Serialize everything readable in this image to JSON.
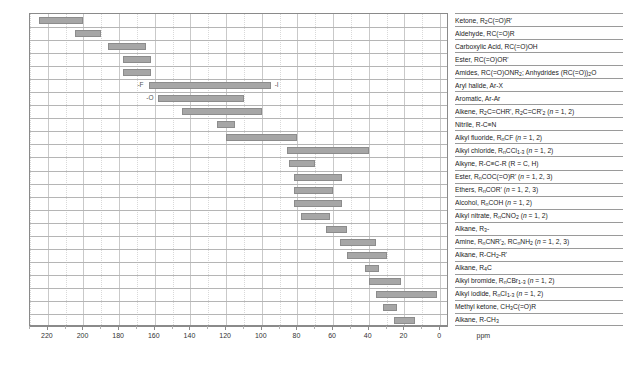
{
  "chart_data": {
    "type": "bar",
    "orientation": "horizontal-range",
    "title": "",
    "xlabel": "ppm",
    "ylabel": "",
    "xlim": [
      230,
      -5
    ],
    "axis_reversed": true,
    "ticks": [
      220,
      200,
      180,
      160,
      140,
      120,
      100,
      80,
      60,
      40,
      20,
      0
    ],
    "tick_labels": [
      "220",
      "200",
      "180",
      "160",
      "140",
      "120",
      "100",
      "80",
      "60",
      "40",
      "20",
      "0"
    ],
    "unit_label": "ppm",
    "grid": "vertical-major-and-minor",
    "legend": "none",
    "bar_color": "#a6a6a6",
    "bar_border_color": "#8c8c8c",
    "categories": [
      "Ketone, R2C(=O)R'",
      "Aldehyde, RC(=O)R",
      "Carboxylic Acid, RC(=O)OH",
      "Ester, RC(=O)OR'",
      "Amides, RC(=O)ONR2; Anhydrides (RC(=O))2O",
      "Aryl halide, Ar-X",
      "Aromatic, Ar-Ar",
      "Alkene, R2C=CHR', R2C=CR'2 (n = 1, 2)",
      "Nitrile, R-C≡N",
      "Alkyl fluoride, RnCF (n = 1, 2)",
      "Alkyl chloride, RnCCl1-3 (n = 1, 2)",
      "Alkyne, R-C≡C-R (R = C, H)",
      "Ester, RnCOC(=O)R' (n = 1, 2, 3)",
      "Ethers, RnCOR' (n = 1, 2, 3)",
      "Alcohol, RnCOH (n = 1, 2)",
      "Alkyl nitrate, RnCNO2 (n = 1, 2)",
      "Alkane, R3C-",
      "Amine, RnCNR'2, RCCNH2 (n = 1, 2, 3)",
      "Alkane, R-CH2-R'",
      "Alkane, R4C",
      "Alkyl bromide, RnCBr1-3 (n = 1, 2)",
      "Alkyl iodide, RnCI1-3 (n = 1, 2)",
      "Methyl ketone, CH3C(=O)R",
      "Alkane, R-CH3"
    ],
    "ranges": [
      {
        "label": "Ketone, R2C(=O)R'",
        "start": 225,
        "end": 200
      },
      {
        "label": "Aldehyde, RC(=O)R",
        "start": 205,
        "end": 190
      },
      {
        "label": "Carboxylic Acid, RC(=O)OH",
        "start": 186,
        "end": 165
      },
      {
        "label": "Ester, RC(=O)OR'",
        "start": 178,
        "end": 162
      },
      {
        "label": "Amides, RC(=O)ONR2; Anhydrides (RC(=O))2O",
        "start": 178,
        "end": 162
      },
      {
        "label": "Aryl halide, Ar-X",
        "start": 163,
        "end": 95,
        "left_note": "-F",
        "right_note": "-I"
      },
      {
        "label": "Aromatic, Ar-Ar",
        "start": 158,
        "end": 110,
        "left_note": "-O"
      },
      {
        "label": "Alkene, R2C=CHR', R2C=CR'2 (n = 1, 2)",
        "start": 145,
        "end": 100
      },
      {
        "label": "Nitrile, R-C≡N",
        "start": 125,
        "end": 115
      },
      {
        "label": "Alkyl fluoride, RnCF (n = 1, 2)",
        "start": 120,
        "end": 80
      },
      {
        "label": "Alkyl chloride, RnCCl1-3 (n = 1, 2)",
        "start": 86,
        "end": 40
      },
      {
        "label": "Alkyne, R-C≡C-R (R = C, H)",
        "start": 85,
        "end": 70
      },
      {
        "label": "Ester, RnCOC(=O)R' (n = 1, 2, 3)",
        "start": 82,
        "end": 55
      },
      {
        "label": "Ethers, RnCOR' (n = 1, 2, 3)",
        "start": 82,
        "end": 60
      },
      {
        "label": "Alcohol, RnCOH (n = 1, 2)",
        "start": 82,
        "end": 55
      },
      {
        "label": "Alkyl nitrate, RnCNO2 (n = 1, 2)",
        "start": 78,
        "end": 62
      },
      {
        "label": "Alkane, R3C-",
        "start": 64,
        "end": 52
      },
      {
        "label": "Amine, RnCNR'2, RCCNH2 (n = 1, 2, 3)",
        "start": 56,
        "end": 36
      },
      {
        "label": "Alkane, R-CH2-R'",
        "start": 52,
        "end": 30
      },
      {
        "label": "Alkane, R4C",
        "start": 42,
        "end": 34
      },
      {
        "label": "Alkyl bromide, RnCBr1-3 (n = 1, 2)",
        "start": 40,
        "end": 22
      },
      {
        "label": "Alkyl iodide, RnCI1-3 (n = 1, 2)",
        "start": 36,
        "end": 2
      },
      {
        "label": "Methyl ketone, CH3C(=O)R",
        "start": 32,
        "end": 24
      },
      {
        "label": "Alkane, R-CH3",
        "start": 26,
        "end": 14
      }
    ]
  },
  "labels_html": [
    "Ketone, R<sub>2</sub>C(=O)R'",
    "Aldehyde, RC(=O)R",
    "Carboxylic Acid, RC(=O)OH",
    "Ester, RC(=O)OR'",
    "Amides, RC(=O)ONR<sub>2</sub>; Anhydrides (RC(=O))<sub>2</sub>O",
    "Aryl halide, Ar-X",
    "Aromatic, Ar-Ar",
    "Alkene, R<sub>2</sub>C=CHR', R<sub>2</sub>C=CR'<sub>2</sub> (<i>n</i> = 1, 2)",
    "Nitrile, R-C&#8801;N",
    "Alkyl fluoride, R<sub>n</sub>CF (<i>n</i> = 1, 2)",
    "Alkyl chloride, R<sub>n</sub>CCl<sub>1-3</sub> (<i>n</i> = 1, 2)",
    "Alkyne, R-C&#8801;C-R (R = C, H)",
    "Ester, R<sub>n</sub>COC(=O)R' (<i>n</i> = 1, 2, 3)",
    "Ethers, R<sub>n</sub>COR' (<i>n</i> = 1, 2, 3)",
    "Alcohol, R<sub>n</sub>COH (<i>n</i> = 1, 2)",
    "Alkyl nitrate, R<sub>n</sub>CNO<sub>2</sub> (<i>n</i> = 1, 2)",
    "Alkane, R<sub>3</sub>-",
    "Amine, R<sub>n</sub>CNR'<sub>2</sub>, RC<sub>n</sub>NH<sub>2</sub> (<i>n</i> = 1, 2, 3)",
    "Alkane, R-CH<sub>2</sub>-R'",
    "Alkane, R<sub>4</sub>C",
    "Alkyl bromide, R<sub>n</sub>CBr<sub>1-3</sub> (<i>n</i> = 1, 2)",
    "Alkyl iodide, R<sub>n</sub>CI<sub>1-3</sub> (<i>n</i> = 1, 2)",
    "Methyl ketone, CH<sub>3</sub>C(=O)R",
    "Alkane, R-CH<sub>3</sub>"
  ]
}
